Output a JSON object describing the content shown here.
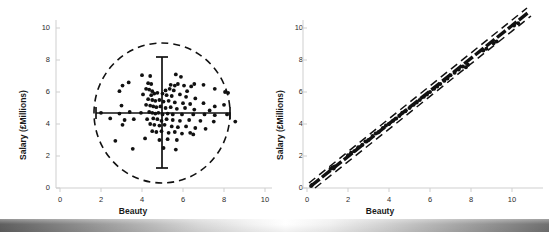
{
  "figure": {
    "background": "#ffffff",
    "panel_count": 2
  },
  "axis_color": "#cfcfcf",
  "marker_color": "#111111",
  "chart_data": [
    {
      "type": "scatter",
      "panel": "left",
      "title": "",
      "xlabel": "Beauty",
      "ylabel": "Salary (£Millions)",
      "xlim": [
        0,
        11
      ],
      "ylim": [
        0,
        11
      ],
      "xticks": [
        0,
        2,
        4,
        6,
        8,
        10
      ],
      "yticks": [
        0,
        2,
        4,
        6,
        8,
        10
      ],
      "grid": false,
      "legend": "none",
      "annotations": {
        "ellipse": {
          "cx": 5.0,
          "cy": 4.65,
          "rx": 3.3,
          "ry": 3.4,
          "style": "dashed"
        },
        "crosshair_vertical": {
          "x": 5.0,
          "y_from": 1.25,
          "y_to": 8.1,
          "style": "solid-with-caps"
        },
        "crosshair_horizontal": {
          "y": 4.65,
          "x_from": 1.75,
          "x_to": 8.3,
          "style": "solid-with-caps"
        }
      },
      "points": [
        [
          4.0,
          7.05
        ],
        [
          4.4,
          7.0
        ],
        [
          5.65,
          7.1
        ],
        [
          5.9,
          6.95
        ],
        [
          3.35,
          6.6
        ],
        [
          3.05,
          6.4
        ],
        [
          4.3,
          6.55
        ],
        [
          4.45,
          6.5
        ],
        [
          5.4,
          6.45
        ],
        [
          5.6,
          6.4
        ],
        [
          5.75,
          6.5
        ],
        [
          6.05,
          6.4
        ],
        [
          6.4,
          6.35
        ],
        [
          6.55,
          6.5
        ],
        [
          2.9,
          6.05
        ],
        [
          4.2,
          6.2
        ],
        [
          4.35,
          6.15
        ],
        [
          4.5,
          6.05
        ],
        [
          5.15,
          6.1
        ],
        [
          5.35,
          6.2
        ],
        [
          5.55,
          6.1
        ],
        [
          6.2,
          6.05
        ],
        [
          7.0,
          6.45
        ],
        [
          7.55,
          6.2
        ],
        [
          8.05,
          6.0
        ],
        [
          8.2,
          5.95
        ],
        [
          4.05,
          5.85
        ],
        [
          4.45,
          5.8
        ],
        [
          4.6,
          5.9
        ],
        [
          4.75,
          5.95
        ],
        [
          5.0,
          5.9
        ],
        [
          5.2,
          5.8
        ],
        [
          5.45,
          5.75
        ],
        [
          5.85,
          5.85
        ],
        [
          6.15,
          5.7
        ],
        [
          6.6,
          5.6
        ],
        [
          4.3,
          5.55
        ],
        [
          4.5,
          5.5
        ],
        [
          4.65,
          5.45
        ],
        [
          4.85,
          5.5
        ],
        [
          5.05,
          5.4
        ],
        [
          5.3,
          5.45
        ],
        [
          5.6,
          5.35
        ],
        [
          6.0,
          5.3
        ],
        [
          6.35,
          5.25
        ],
        [
          7.0,
          5.3
        ],
        [
          7.55,
          5.1
        ],
        [
          8.0,
          5.2
        ],
        [
          3.0,
          5.15
        ],
        [
          4.2,
          5.2
        ],
        [
          4.4,
          5.15
        ],
        [
          4.55,
          5.1
        ],
        [
          4.7,
          5.05
        ],
        [
          4.9,
          5.1
        ],
        [
          5.15,
          5.0
        ],
        [
          5.4,
          5.05
        ],
        [
          5.7,
          4.95
        ],
        [
          6.1,
          5.0
        ],
        [
          6.55,
          4.9
        ],
        [
          7.3,
          4.85
        ],
        [
          2.0,
          4.7
        ],
        [
          2.9,
          4.65
        ],
        [
          3.4,
          4.75
        ],
        [
          3.95,
          4.7
        ],
        [
          4.35,
          4.75
        ],
        [
          4.5,
          4.7
        ],
        [
          4.65,
          4.65
        ],
        [
          4.8,
          4.7
        ],
        [
          5.0,
          4.6
        ],
        [
          5.25,
          4.65
        ],
        [
          5.5,
          4.6
        ],
        [
          5.95,
          4.6
        ],
        [
          6.5,
          4.6
        ],
        [
          7.05,
          4.6
        ],
        [
          7.55,
          4.55
        ],
        [
          8.15,
          4.6
        ],
        [
          2.45,
          4.35
        ],
        [
          3.15,
          4.25
        ],
        [
          3.6,
          4.3
        ],
        [
          4.25,
          4.3
        ],
        [
          4.55,
          4.35
        ],
        [
          4.75,
          4.3
        ],
        [
          4.95,
          4.2
        ],
        [
          5.2,
          4.3
        ],
        [
          5.5,
          4.25
        ],
        [
          5.85,
          4.2
        ],
        [
          6.3,
          4.25
        ],
        [
          6.85,
          4.2
        ],
        [
          7.5,
          4.15
        ],
        [
          8.55,
          4.15
        ],
        [
          3.05,
          3.95
        ],
        [
          4.4,
          4.0
        ],
        [
          4.6,
          3.95
        ],
        [
          4.85,
          3.9
        ],
        [
          5.1,
          3.95
        ],
        [
          5.45,
          3.85
        ],
        [
          5.75,
          3.8
        ],
        [
          6.15,
          3.85
        ],
        [
          6.6,
          3.75
        ],
        [
          7.1,
          3.7
        ],
        [
          4.5,
          3.55
        ],
        [
          4.7,
          3.5
        ],
        [
          4.95,
          3.55
        ],
        [
          5.3,
          3.45
        ],
        [
          5.6,
          3.5
        ],
        [
          5.95,
          3.4
        ],
        [
          6.35,
          3.45
        ],
        [
          6.5,
          3.35
        ],
        [
          2.7,
          2.95
        ],
        [
          4.15,
          3.1
        ],
        [
          4.85,
          3.0
        ],
        [
          5.25,
          3.05
        ],
        [
          5.7,
          3.0
        ],
        [
          3.55,
          2.45
        ],
        [
          5.05,
          2.5
        ],
        [
          5.65,
          2.4
        ]
      ]
    },
    {
      "type": "scatter",
      "panel": "right",
      "title": "",
      "xlabel": "Beauty",
      "ylabel": "Salary (£Millions)",
      "xlim": [
        0,
        11
      ],
      "ylim": [
        0,
        11
      ],
      "xticks": [
        0,
        2,
        4,
        6,
        8,
        10
      ],
      "yticks": [
        0,
        2,
        4,
        6,
        8,
        10
      ],
      "grid": false,
      "legend": "none",
      "annotations": {
        "band_center": {
          "slope": 1.0,
          "intercept": 0.0,
          "style": "thick-dashed"
        },
        "band_upper": {
          "slope": 1.02,
          "intercept": 0.35,
          "style": "dashed"
        },
        "band_lower": {
          "slope": 0.98,
          "intercept": -0.42,
          "style": "dashed"
        }
      },
      "points": [
        [
          0.2,
          0.12
        ],
        [
          0.25,
          0.2
        ],
        [
          1.15,
          1.2
        ],
        [
          1.25,
          1.3
        ],
        [
          1.3,
          1.22
        ],
        [
          1.35,
          1.35
        ],
        [
          2.0,
          2.05
        ],
        [
          2.15,
          2.2
        ],
        [
          2.3,
          2.3
        ],
        [
          2.5,
          2.55
        ],
        [
          2.7,
          2.7
        ],
        [
          2.85,
          2.9
        ],
        [
          3.0,
          3.0
        ],
        [
          3.2,
          3.25
        ],
        [
          3.35,
          3.4
        ],
        [
          3.5,
          3.5
        ],
        [
          3.7,
          3.75
        ],
        [
          3.85,
          3.9
        ],
        [
          4.0,
          4.0
        ],
        [
          4.2,
          4.2
        ],
        [
          4.35,
          4.35
        ],
        [
          4.5,
          4.5
        ],
        [
          4.65,
          4.7
        ],
        [
          4.8,
          4.8
        ],
        [
          5.0,
          5.0
        ],
        [
          5.2,
          5.2
        ],
        [
          5.35,
          5.35
        ],
        [
          5.5,
          5.5
        ],
        [
          5.7,
          5.7
        ],
        [
          5.85,
          5.85
        ],
        [
          6.0,
          6.0
        ],
        [
          6.2,
          6.2
        ],
        [
          6.35,
          6.35
        ],
        [
          6.5,
          6.5
        ],
        [
          6.7,
          6.7
        ],
        [
          6.85,
          6.85
        ],
        [
          7.0,
          7.05
        ],
        [
          7.2,
          7.2
        ],
        [
          7.4,
          7.4
        ],
        [
          7.6,
          7.6
        ],
        [
          7.75,
          7.55
        ],
        [
          7.85,
          7.7
        ],
        [
          8.6,
          8.6
        ],
        [
          8.75,
          8.7
        ],
        [
          9.1,
          9.05
        ],
        [
          9.25,
          9.15
        ],
        [
          10.1,
          10.15
        ],
        [
          10.3,
          10.3
        ]
      ]
    }
  ],
  "panels": {
    "left": {
      "xlabel": "Beauty",
      "ylabel": "Salary (£Millions)",
      "xticks": [
        "0",
        "2",
        "4",
        "6",
        "8",
        "10"
      ],
      "yticks": [
        "0",
        "2",
        "4",
        "6",
        "8",
        "10"
      ]
    },
    "right": {
      "xlabel": "Beauty",
      "ylabel": "Salary (£Millions)",
      "xticks": [
        "0",
        "2",
        "4",
        "6",
        "8",
        "10"
      ],
      "yticks": [
        "0",
        "2",
        "4",
        "6",
        "8",
        "10"
      ]
    }
  }
}
